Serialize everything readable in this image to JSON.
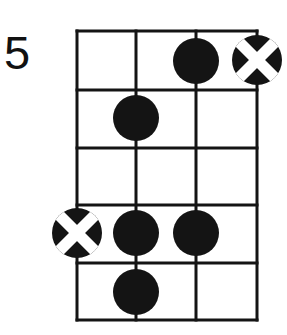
{
  "diagram": {
    "kind": "guitar-chord-diagram",
    "fret_position_label": "5",
    "instrument_strings_shown": 4,
    "frets_shown": 5,
    "colors": {
      "ink": "#141414",
      "paper": "#ffffff",
      "marker_fill": "#141414",
      "marker_cross": "#ffffff"
    },
    "grid": {
      "left": 77,
      "right": 257,
      "top": 31,
      "bottom": 320,
      "string_x": [
        77,
        136,
        196,
        257
      ],
      "fret_y": [
        31,
        90,
        148,
        205,
        263,
        320
      ],
      "line_width": 3
    },
    "markers": [
      {
        "id": "marker-1",
        "type": "filled-dot",
        "string_index": 2,
        "fret_index": 0,
        "cx": 196,
        "cy": 61,
        "r": 23,
        "label": "dot-string3-fret1"
      },
      {
        "id": "marker-2",
        "type": "cross-circle",
        "string_index": 3,
        "fret_index": 0,
        "cx": 257,
        "cy": 60,
        "r": 25,
        "label": "cross-string4-fret1"
      },
      {
        "id": "marker-3",
        "type": "filled-dot",
        "string_index": 1,
        "fret_index": 1,
        "cx": 136,
        "cy": 118,
        "r": 23,
        "label": "dot-string2-fret2"
      },
      {
        "id": "marker-4",
        "type": "cross-circle",
        "string_index": 0,
        "fret_index": 3,
        "cx": 77,
        "cy": 233,
        "r": 25,
        "label": "cross-string1-fret4"
      },
      {
        "id": "marker-5",
        "type": "filled-dot",
        "string_index": 1,
        "fret_index": 3,
        "cx": 136,
        "cy": 233,
        "r": 23,
        "label": "dot-string2-fret4"
      },
      {
        "id": "marker-6",
        "type": "filled-dot",
        "string_index": 2,
        "fret_index": 3,
        "cx": 196,
        "cy": 233,
        "r": 23,
        "label": "dot-string3-fret4"
      },
      {
        "id": "marker-7",
        "type": "filled-dot",
        "string_index": 1,
        "fret_index": 4,
        "cx": 136,
        "cy": 292,
        "r": 23,
        "label": "dot-string2-fret5"
      }
    ]
  }
}
